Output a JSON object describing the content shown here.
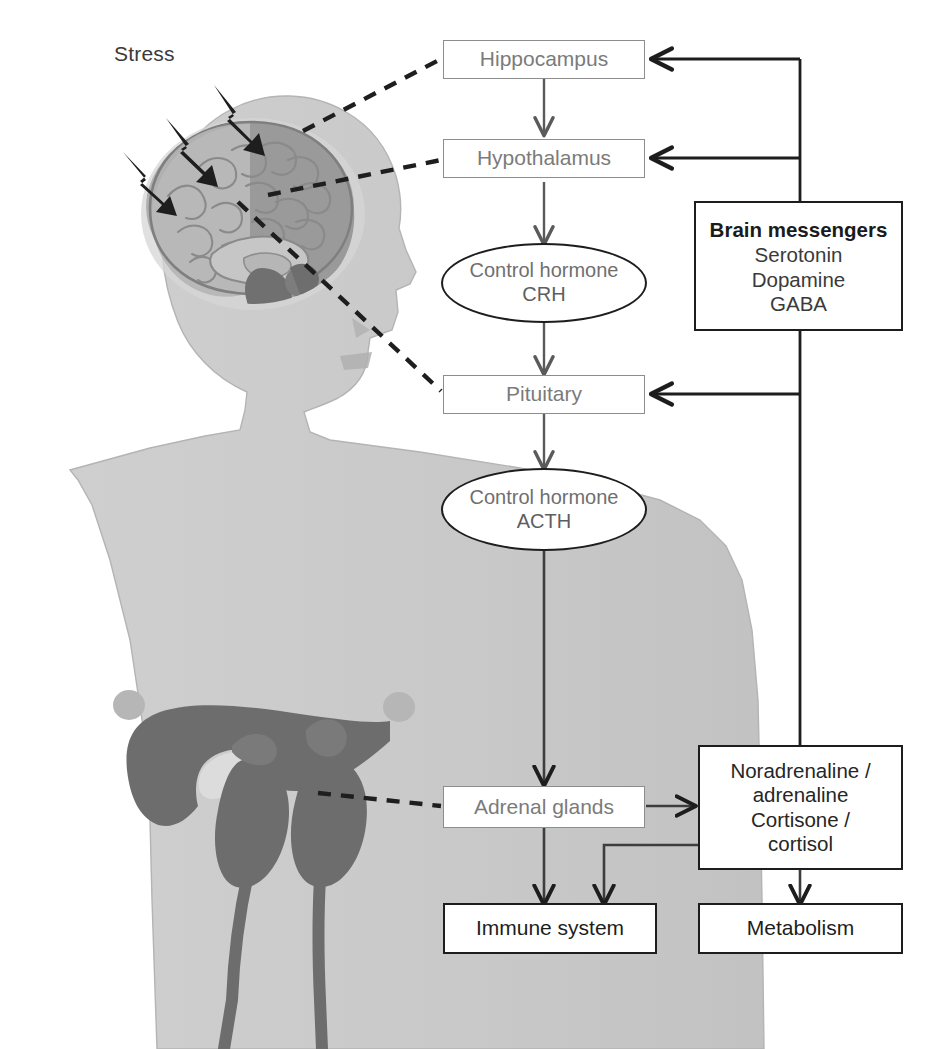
{
  "diagram": {
    "background_color": "#ffffff",
    "body_silhouette_color": "#c9c9c9",
    "organ_dark_color": "#6e6e6e",
    "brain_color": "#a8a8a8",
    "box_border_gray": "#8d8d8d",
    "box_border_black": "#1d1d1d",
    "text_gray": "#7b7b7b",
    "text_black": "#1d1d1d"
  },
  "labels": {
    "stress": "Stress"
  },
  "nodes": {
    "hippocampus": {
      "label": "Hippocampus"
    },
    "hypothalamus": {
      "label": "Hypothalamus"
    },
    "crh": {
      "line1": "Control hormone",
      "line2": "CRH"
    },
    "pituitary": {
      "label": "Pituitary"
    },
    "acth": {
      "line1": "Control hormone",
      "line2": "ACTH"
    },
    "adrenal_glands": {
      "label": "Adrenal glands"
    },
    "immune_system": {
      "label": "Immune system"
    },
    "metabolism": {
      "label": "Metabolism"
    },
    "brain_messengers": {
      "title": "Brain messengers",
      "items": [
        "Serotonin",
        "Dopamine",
        "GABA"
      ]
    },
    "hormones": {
      "lines": [
        "Noradrenaline /",
        "adrenaline",
        "Cortisone /",
        "cortisol"
      ]
    }
  },
  "icons": {
    "stress_bolt": "lightning-bolt-arrow-icon",
    "human_figure": "human-body-silhouette-icon",
    "brain": "sagittal-brain-icon",
    "liver": "liver-icon",
    "kidney_left": "kidney-icon",
    "kidney_right": "kidney-icon",
    "adrenal_left": "adrenal-gland-icon",
    "adrenal_right": "adrenal-gland-icon"
  },
  "connections": [
    {
      "from": "hippocampus",
      "to": "hypothalamus",
      "style": "solid-arrow"
    },
    {
      "from": "hypothalamus",
      "to": "crh",
      "style": "solid-arrow"
    },
    {
      "from": "crh",
      "to": "pituitary",
      "style": "solid-arrow"
    },
    {
      "from": "pituitary",
      "to": "acth",
      "style": "solid-arrow"
    },
    {
      "from": "acth",
      "to": "adrenal_glands",
      "style": "solid-arrow"
    },
    {
      "from": "adrenal_glands",
      "to": "hormones",
      "style": "solid-arrow"
    },
    {
      "from": "adrenal_glands",
      "to": "immune_system",
      "style": "solid-arrow"
    },
    {
      "from": "hormones",
      "to": "metabolism",
      "style": "solid-arrow"
    },
    {
      "from": "hormones",
      "to": "immune_system",
      "style": "solid-arrow"
    },
    {
      "from": "hormones",
      "to": "hippocampus",
      "style": "feedback-arrow"
    },
    {
      "from": "hormones",
      "to": "hypothalamus",
      "style": "feedback-arrow"
    },
    {
      "from": "hormones",
      "to": "pituitary",
      "style": "feedback-arrow"
    },
    {
      "from": "brain_region",
      "to": "hippocampus",
      "style": "dashed"
    },
    {
      "from": "brain_region",
      "to": "hypothalamus",
      "style": "dashed"
    },
    {
      "from": "brain_region",
      "to": "pituitary",
      "style": "dashed"
    },
    {
      "from": "adrenal_organ",
      "to": "adrenal_glands",
      "style": "dashed"
    }
  ]
}
